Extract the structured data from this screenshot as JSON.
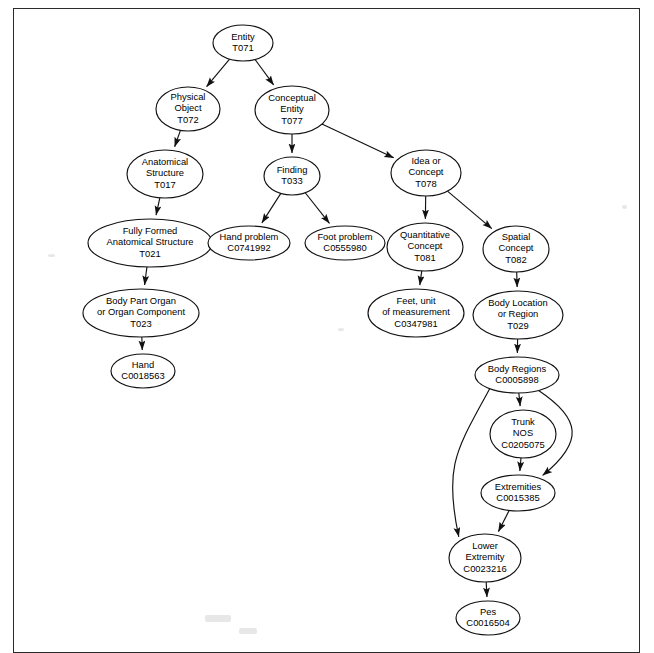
{
  "figure": {
    "kind": "directed-acyclic-graph",
    "border_color": "#2b2b2b",
    "node_stroke": "#111111",
    "node_fill": "#ffffff",
    "edge_color": "#111111"
  },
  "nodes": [
    {
      "id": "entity",
      "lines": [
        "Entity",
        "T071"
      ],
      "cx": 243,
      "cy": 43,
      "rx": 30,
      "ry": 18
    },
    {
      "id": "physical_object",
      "lines": [
        "Physical",
        "Object",
        "T072"
      ],
      "cx": 188,
      "cy": 109,
      "rx": 32,
      "ry": 22
    },
    {
      "id": "conceptual_entity",
      "lines": [
        "Conceptual",
        "Entity",
        "T077"
      ],
      "cx": 292,
      "cy": 110,
      "rx": 37,
      "ry": 24
    },
    {
      "id": "anatomical_structure",
      "lines": [
        "Anatomical",
        "Structure",
        "T017"
      ],
      "cx": 165,
      "cy": 174,
      "rx": 38,
      "ry": 24
    },
    {
      "id": "finding",
      "lines": [
        "Finding",
        "T033"
      ],
      "cx": 292,
      "cy": 176,
      "rx": 28,
      "ry": 19
    },
    {
      "id": "idea_or_concept",
      "lines": [
        "Idea or",
        "Concept",
        "T078"
      ],
      "cx": 426,
      "cy": 173,
      "rx": 35,
      "ry": 23
    },
    {
      "id": "fully_formed",
      "lines": [
        "Fully Formed",
        "Anatomical Structure",
        "T021"
      ],
      "cx": 150,
      "cy": 243,
      "rx": 62,
      "ry": 24
    },
    {
      "id": "hand_problem",
      "lines": [
        "Hand problem",
        "C0741992"
      ],
      "cx": 249,
      "cy": 243,
      "rx": 41,
      "ry": 17
    },
    {
      "id": "foot_problem",
      "lines": [
        "Foot problem",
        "C0555980"
      ],
      "cx": 345,
      "cy": 243,
      "rx": 40,
      "ry": 17
    },
    {
      "id": "quantitative_concept",
      "lines": [
        "Quantitative",
        "Concept",
        "T081"
      ],
      "cx": 425,
      "cy": 247,
      "rx": 38,
      "ry": 24
    },
    {
      "id": "spatial_concept",
      "lines": [
        "Spatial",
        "Concept",
        "T082"
      ],
      "cx": 516,
      "cy": 249,
      "rx": 33,
      "ry": 23
    },
    {
      "id": "body_part_organ",
      "lines": [
        "Body Part Organ",
        "or Organ Component",
        "T023"
      ],
      "cx": 141,
      "cy": 313,
      "rx": 58,
      "ry": 24
    },
    {
      "id": "feet_unit",
      "lines": [
        "Feet, unit",
        "of measurement",
        "C0347981"
      ],
      "cx": 416,
      "cy": 313,
      "rx": 48,
      "ry": 24
    },
    {
      "id": "body_location",
      "lines": [
        "Body Location",
        "or Region",
        "T029"
      ],
      "cx": 518,
      "cy": 315,
      "rx": 45,
      "ry": 24
    },
    {
      "id": "hand",
      "lines": [
        "Hand",
        "C0018563"
      ],
      "cx": 143,
      "cy": 371,
      "rx": 32,
      "ry": 17
    },
    {
      "id": "body_regions",
      "lines": [
        "Body Regions",
        "C0005898"
      ],
      "cx": 517,
      "cy": 375,
      "rx": 42,
      "ry": 18
    },
    {
      "id": "trunk_nos",
      "lines": [
        "Trunk",
        "NOS",
        "C0205075"
      ],
      "cx": 523,
      "cy": 434,
      "rx": 33,
      "ry": 24
    },
    {
      "id": "extremities",
      "lines": [
        "Extremities",
        "C0015385"
      ],
      "cx": 518,
      "cy": 493,
      "rx": 37,
      "ry": 18
    },
    {
      "id": "lower_extremity",
      "lines": [
        "Lower",
        "Extremity",
        "C0023216"
      ],
      "cx": 485,
      "cy": 558,
      "rx": 36,
      "ry": 24
    },
    {
      "id": "pes",
      "lines": [
        "Pes",
        "C0016504"
      ],
      "cx": 488,
      "cy": 618,
      "rx": 32,
      "ry": 17
    }
  ],
  "edges": [
    {
      "from": "entity",
      "to": "physical_object"
    },
    {
      "from": "entity",
      "to": "conceptual_entity"
    },
    {
      "from": "physical_object",
      "to": "anatomical_structure"
    },
    {
      "from": "conceptual_entity",
      "to": "finding"
    },
    {
      "from": "conceptual_entity",
      "to": "idea_or_concept"
    },
    {
      "from": "anatomical_structure",
      "to": "fully_formed"
    },
    {
      "from": "finding",
      "to": "hand_problem"
    },
    {
      "from": "finding",
      "to": "foot_problem"
    },
    {
      "from": "idea_or_concept",
      "to": "quantitative_concept"
    },
    {
      "from": "idea_or_concept",
      "to": "spatial_concept"
    },
    {
      "from": "fully_formed",
      "to": "body_part_organ"
    },
    {
      "from": "quantitative_concept",
      "to": "feet_unit"
    },
    {
      "from": "spatial_concept",
      "to": "body_location"
    },
    {
      "from": "body_part_organ",
      "to": "hand"
    },
    {
      "from": "body_location",
      "to": "body_regions"
    },
    {
      "from": "body_regions",
      "to": "trunk_nos"
    },
    {
      "from": "body_regions",
      "to": "extremities",
      "curve": "right"
    },
    {
      "from": "body_regions",
      "to": "lower_extremity",
      "curve": "left"
    },
    {
      "from": "trunk_nos",
      "to": "extremities"
    },
    {
      "from": "extremities",
      "to": "lower_extremity"
    },
    {
      "from": "lower_extremity",
      "to": "pes"
    }
  ]
}
